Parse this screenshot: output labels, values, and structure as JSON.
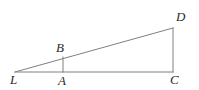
{
  "figure": {
    "kind": "geometry-diagram",
    "background_color": "#ffffff",
    "stroke_color": "#808080",
    "label_color": "#2b2b2b",
    "stroke_width": 1,
    "canvas": {
      "width": 199,
      "height": 90
    },
    "points": {
      "L": {
        "x": 15,
        "y": 72
      },
      "A": {
        "x": 63,
        "y": 72
      },
      "B": {
        "x": 63,
        "y": 57
      },
      "C": {
        "x": 173,
        "y": 72
      },
      "D": {
        "x": 173,
        "y": 28
      }
    },
    "segments": [
      {
        "name": "hypotenuse-LD",
        "from": "L",
        "to": "D"
      },
      {
        "name": "base-LC",
        "from": "L",
        "to": "C"
      },
      {
        "name": "vertical-DC",
        "from": "D",
        "to": "C"
      },
      {
        "name": "vertical-AB",
        "from": "A",
        "to": "B"
      }
    ],
    "labels": [
      {
        "id": "label-D",
        "text": "D",
        "x": 176,
        "y": 10
      },
      {
        "id": "label-B",
        "text": "B",
        "x": 56,
        "y": 41
      },
      {
        "id": "label-L",
        "text": "L",
        "x": 10,
        "y": 73
      },
      {
        "id": "label-A",
        "text": "A",
        "x": 58,
        "y": 74
      },
      {
        "id": "label-C",
        "text": "C",
        "x": 170,
        "y": 73
      }
    ]
  }
}
